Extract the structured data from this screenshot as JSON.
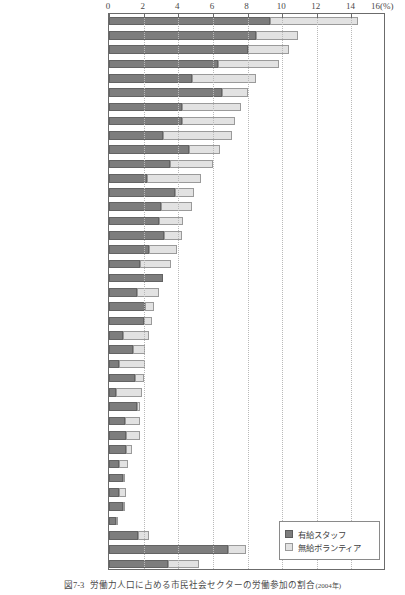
{
  "figure": {
    "caption_number": "図7-3",
    "caption_title": "労働力人口に占める市民社会セクターの労働参加の割合",
    "caption_source": "(2004年)"
  },
  "axis": {
    "unit_label": "(%)",
    "ticks": [
      0,
      2,
      4,
      6,
      8,
      10,
      12,
      14,
      16
    ],
    "min": 0,
    "max": 16
  },
  "legend": {
    "position": "bottom-right",
    "items": [
      {
        "label": "有給スタッフ",
        "color": "#7d7d7d"
      },
      {
        "label": "無給ボランティア",
        "color": "#e2e2e2"
      }
    ]
  },
  "chart_data": {
    "type": "bar",
    "orientation": "horizontal",
    "stacked": true,
    "title": "労働力人口に占める市民社会セクターの労働参加の割合",
    "xlabel": "(%)",
    "ylabel": "",
    "xlim": [
      0,
      16
    ],
    "grid": true,
    "categories": [
      "オランダ",
      "ベルギー",
      "アイルランド",
      "アメリカ",
      "イギリス",
      "イスラエル",
      "フランス",
      "ノルウェー",
      "スウェーデン",
      "オーストラリア",
      "ドイツ",
      "フィンランド",
      "オーストリア",
      "アルゼンチン",
      "スペイン",
      "日　本",
      "イタリア",
      "南アフリカ",
      "エジプト",
      "ペルー",
      "コロンビア",
      "韓　国",
      "ウガンダ",
      "ケニヤ",
      "タンザニア",
      "チェコ",
      "フィリピン",
      "ブラジル",
      "モロッコ",
      "インド",
      "ハンガリー",
      "パキスタン",
      "ポーランド",
      "ルーマニア",
      "スロヴァキア",
      "メキシコ",
      "発展途上・民主化移行国",
      "先進国",
      "36カ国平均"
    ],
    "series": [
      {
        "name": "有給スタッフ",
        "color": "#7d7d7d",
        "values": [
          9.3,
          8.5,
          8.0,
          6.3,
          4.8,
          6.5,
          4.2,
          4.2,
          3.1,
          4.6,
          3.5,
          2.2,
          3.8,
          3.0,
          2.9,
          3.2,
          2.3,
          1.8,
          3.1,
          1.6,
          2.1,
          2.0,
          0.8,
          1.4,
          0.6,
          1.5,
          0.4,
          1.6,
          0.9,
          1.0,
          1.0,
          0.6,
          0.8,
          0.6,
          0.8,
          0.4,
          1.7,
          6.9,
          3.4
        ]
      },
      {
        "name": "無給ボランティア",
        "color": "#e2e2e2",
        "values": [
          5.1,
          2.4,
          2.4,
          3.5,
          3.7,
          1.5,
          3.4,
          3.1,
          4.0,
          1.8,
          2.5,
          3.1,
          1.1,
          1.8,
          1.4,
          1.0,
          1.6,
          1.8,
          0.0,
          1.3,
          0.5,
          0.5,
          1.5,
          0.7,
          1.5,
          0.5,
          1.5,
          0.2,
          0.9,
          0.8,
          0.3,
          0.5,
          0.1,
          0.4,
          0.1,
          0.1,
          0.6,
          1.0,
          1.8
        ]
      }
    ],
    "totals": [
      14.4,
      10.9,
      10.4,
      9.8,
      8.5,
      8.0,
      7.6,
      7.3,
      7.1,
      6.4,
      6.0,
      5.3,
      4.9,
      4.8,
      4.3,
      4.2,
      3.9,
      3.6,
      3.1,
      2.9,
      2.6,
      2.5,
      2.3,
      2.1,
      2.1,
      2.0,
      1.9,
      1.8,
      1.8,
      1.8,
      1.3,
      1.1,
      0.9,
      1.0,
      0.9,
      0.5,
      2.3,
      7.9,
      5.2
    ]
  }
}
